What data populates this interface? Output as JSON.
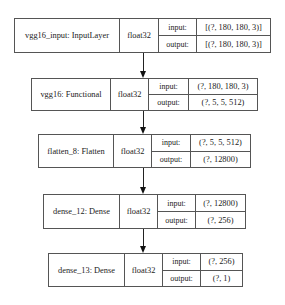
{
  "diagram": {
    "type": "keras-model-plot",
    "nodes": [
      {
        "id": "vgg16_input",
        "label": "vgg16_input: InputLayer",
        "dtype": "float32",
        "input_label": "input:",
        "input_shape": "[(?, 180, 180, 3)]",
        "output_label": "output:",
        "output_shape": "[(?, 180, 180, 3)]"
      },
      {
        "id": "vgg16",
        "label": "vgg16: Functional",
        "dtype": "float32",
        "input_label": "input:",
        "input_shape": "(?, 180, 180, 3)",
        "output_label": "output:",
        "output_shape": "(?, 5, 5, 512)"
      },
      {
        "id": "flatten_8",
        "label": "flatten_8: Flatten",
        "dtype": "float32",
        "input_label": "input:",
        "input_shape": "(?, 5, 5, 512)",
        "output_label": "output:",
        "output_shape": "(?, 12800)"
      },
      {
        "id": "dense_12",
        "label": "dense_12: Dense",
        "dtype": "float32",
        "input_label": "input:",
        "input_shape": "(?, 12800)",
        "output_label": "output:",
        "output_shape": "(?, 256)"
      },
      {
        "id": "dense_13",
        "label": "dense_13: Dense",
        "dtype": "float32",
        "input_label": "input:",
        "input_shape": "(?, 256)",
        "output_label": "output:",
        "output_shape": "(?, 1)"
      }
    ],
    "edges": [
      {
        "from": "vgg16_input",
        "to": "vgg16"
      },
      {
        "from": "vgg16",
        "to": "flatten_8"
      },
      {
        "from": "flatten_8",
        "to": "dense_12"
      },
      {
        "from": "dense_12",
        "to": "dense_13"
      }
    ]
  }
}
